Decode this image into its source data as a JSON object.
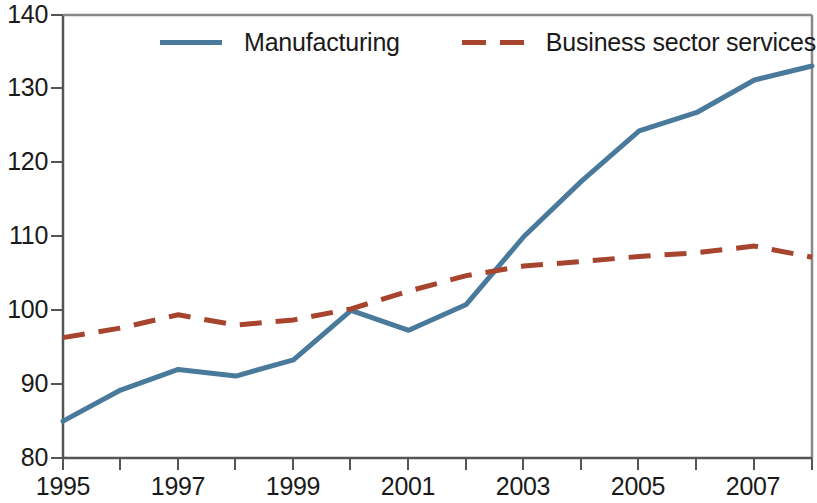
{
  "chart_data": {
    "type": "line",
    "title": "",
    "subtitle": "",
    "xlabel": "",
    "ylabel": "",
    "xlim": [
      1995,
      2008
    ],
    "ylim": [
      80,
      140
    ],
    "yticks": [
      80,
      90,
      100,
      110,
      120,
      130,
      140
    ],
    "ytick_labels": [
      "80",
      "90",
      "100",
      "110",
      "120",
      "130",
      "140"
    ],
    "x": [
      1995,
      1996,
      1997,
      1998,
      1999,
      2000,
      2001,
      2002,
      2003,
      2004,
      2005,
      2006,
      2007,
      2008
    ],
    "xticks": [
      1995,
      1996,
      1997,
      1998,
      1999,
      2000,
      2001,
      2002,
      2003,
      2004,
      2005,
      2006,
      2007,
      2008
    ],
    "xtick_labels": [
      "1995",
      "",
      "1997",
      "",
      "1999",
      "",
      "2001",
      "",
      "2003",
      "",
      "2005",
      "",
      "2007",
      ""
    ],
    "xtick_labels_shown": [
      "1995",
      "1997",
      "1999",
      "2001",
      "2003",
      "2005",
      "2007"
    ],
    "grid": false,
    "legend_position": "top-center",
    "series": [
      {
        "name": "Manufacturing",
        "style": "solid",
        "color": "#4a7a9b",
        "values": [
          85.0,
          89.2,
          92.0,
          91.1,
          93.3,
          100.0,
          97.3,
          100.8,
          110.0,
          117.5,
          124.3,
          126.8,
          131.2,
          133.1
        ]
      },
      {
        "name": "Business sector services",
        "style": "dashed",
        "color": "#a6442e",
        "values": [
          96.3,
          97.6,
          99.4,
          98.0,
          98.7,
          100.2,
          102.6,
          104.7,
          106.0,
          106.6,
          107.3,
          107.8,
          108.7,
          107.2
        ]
      }
    ]
  },
  "legend": {
    "entries": [
      {
        "label": "Manufacturing"
      },
      {
        "label": "Business sector services"
      }
    ]
  },
  "axes": {
    "y_labels": [
      "140",
      "130",
      "120",
      "110",
      "100",
      "90",
      "80"
    ],
    "x_labels": [
      "1995",
      "1997",
      "1999",
      "2001",
      "2003",
      "2005",
      "2007"
    ]
  },
  "colors": {
    "manufacturing": "#4a7a9b",
    "business_sector_services": "#a6442e",
    "axis": "#555555",
    "background": "#ffffff"
  }
}
